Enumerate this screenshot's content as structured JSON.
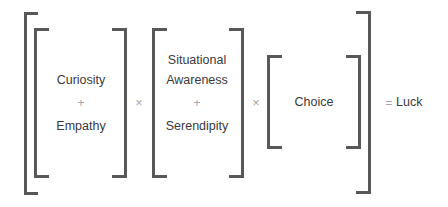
{
  "equation": {
    "group1": {
      "term_a": "Curiosity",
      "operator": "+",
      "term_b": "Empathy"
    },
    "multiply_1": "×",
    "group2": {
      "term_a_line1": "Situational",
      "term_a_line2": "Awareness",
      "operator": "+",
      "term_b": "Serendipity"
    },
    "multiply_2": "×",
    "group3": {
      "term": "Choice"
    },
    "equals": "=",
    "result": "Luck"
  },
  "colors": {
    "bracket": "#58585a",
    "text": "#3a3a3c",
    "operator": "#a5a5a8",
    "background": "#ffffff"
  }
}
